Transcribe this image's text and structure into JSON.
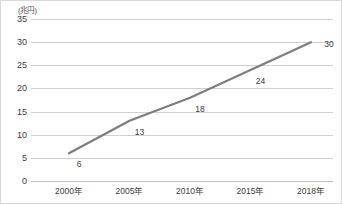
{
  "chart_data": {
    "type": "line",
    "title": "",
    "subtitle": "",
    "unit_label": "(兆円)",
    "xlabel": "",
    "ylabel": "",
    "categories": [
      "2000年",
      "2005年",
      "2010年",
      "2015年",
      "2018年"
    ],
    "x_tick_labels": [
      "2000年",
      "2005年",
      "2010年",
      "2015年",
      "2018年"
    ],
    "y_tick_labels": [
      "0",
      "5",
      "10",
      "15",
      "20",
      "25",
      "30",
      "35"
    ],
    "y_ticks": [
      0,
      5,
      10,
      15,
      20,
      25,
      30,
      35
    ],
    "ylim": [
      0,
      35
    ],
    "grid": true,
    "legend": false,
    "legend_position": "none",
    "series": [
      {
        "name": "",
        "values": [
          6,
          13,
          18,
          24,
          30
        ],
        "point_labels": [
          "6",
          "13",
          "18",
          "24",
          "30"
        ],
        "color": "#7d7d7d",
        "line_width": 2.2,
        "markers": false
      }
    ],
    "colors": {
      "line": "#7d7d7d",
      "gridline": "#d0d0d0",
      "axis": "#bdbdbd",
      "text": "#3c3c3c",
      "background": "#ffffff",
      "border": "#d8d8d8"
    }
  }
}
